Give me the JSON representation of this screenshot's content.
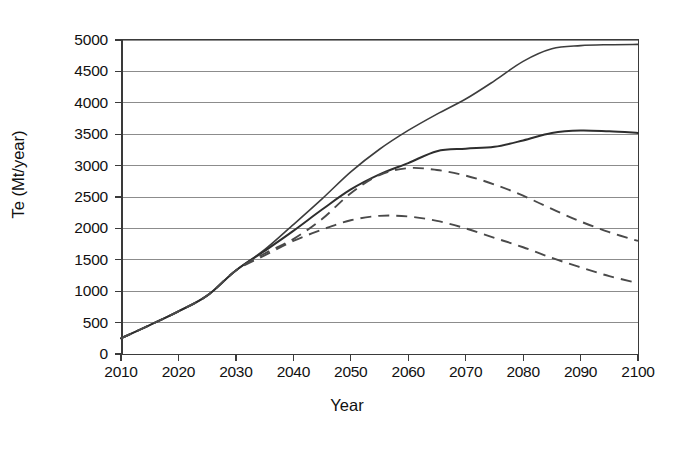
{
  "chart_data": {
    "type": "line",
    "title": "",
    "xlabel": "Year",
    "ylabel": "Te (Mt/year)",
    "xlim": [
      2010,
      2100
    ],
    "ylim": [
      0,
      5000
    ],
    "xticks": [
      2010,
      2020,
      2030,
      2040,
      2050,
      2060,
      2070,
      2080,
      2090,
      2100
    ],
    "yticks": [
      0,
      500,
      1000,
      1500,
      2000,
      2500,
      3000,
      3500,
      4000,
      4500,
      5000
    ],
    "grid": "horizontal",
    "legend": "none",
    "x": [
      2010,
      2015,
      2020,
      2025,
      2030,
      2035,
      2040,
      2045,
      2050,
      2055,
      2060,
      2065,
      2070,
      2075,
      2080,
      2085,
      2090,
      2095,
      2100
    ],
    "series": [
      {
        "name": "upper-solid",
        "style": "solid",
        "values": [
          250,
          460,
          680,
          930,
          1330,
          1660,
          2060,
          2470,
          2900,
          3260,
          3560,
          3820,
          4060,
          4350,
          4660,
          4860,
          4910,
          4925,
          4930
        ]
      },
      {
        "name": "middle-solid",
        "style": "solid",
        "values": [
          250,
          460,
          680,
          930,
          1330,
          1640,
          1960,
          2300,
          2620,
          2860,
          3040,
          3230,
          3270,
          3300,
          3400,
          3520,
          3560,
          3545,
          3520
        ]
      },
      {
        "name": "upper-dashed",
        "style": "dashed",
        "values": [
          250,
          460,
          680,
          930,
          1330,
          1600,
          1830,
          2150,
          2560,
          2850,
          2960,
          2930,
          2840,
          2700,
          2520,
          2310,
          2110,
          1940,
          1800
        ]
      },
      {
        "name": "lower-dashed",
        "style": "dashed",
        "values": [
          250,
          460,
          680,
          930,
          1330,
          1570,
          1800,
          1980,
          2130,
          2200,
          2190,
          2120,
          2000,
          1850,
          1700,
          1530,
          1380,
          1240,
          1130
        ]
      }
    ]
  }
}
